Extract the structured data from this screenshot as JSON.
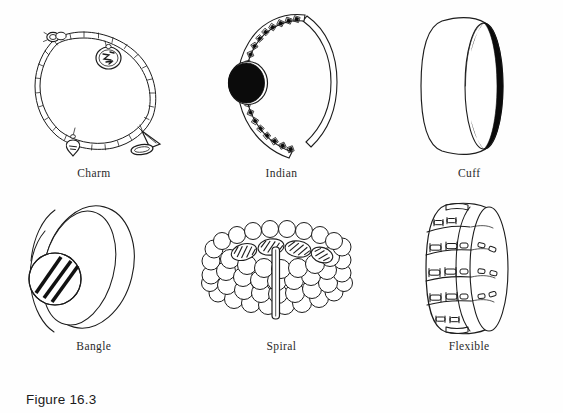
{
  "figure": {
    "caption": "Figure 16.3",
    "number": "16.3",
    "background_color": "#fefefe",
    "ink_color": "#1c1c1c"
  },
  "items": [
    {
      "id": "charm",
      "label": "Charm",
      "icon": "charm-bracelet-illustration",
      "row": 1,
      "column": 1,
      "description": "Oval chain-link bracelet with clasp, round disc charm, heart charm and shoe charm"
    },
    {
      "id": "indian",
      "label": "Indian",
      "icon": "indian-bracelet-illustration",
      "row": 1,
      "column": 2,
      "description": "Open C-shaped cuff with large black oval stone and small inset square stones",
      "stone_color": "#0b0b0b"
    },
    {
      "id": "cuff",
      "label": "Cuff",
      "icon": "cuff-bracelet-illustration",
      "row": 1,
      "column": 3,
      "description": "Wide solid band in three-quarter perspective with dark inner crescent",
      "shadow_color": "#0b0b0b"
    },
    {
      "id": "bangle",
      "label": "Bangle",
      "icon": "bangle-bracelet-illustration",
      "row": 2,
      "column": 1,
      "description": "Tilted rigid band with round medallion bearing diagonal stripes"
    },
    {
      "id": "spiral",
      "label": "Spiral",
      "icon": "spiral-bracelet-illustration",
      "row": 2,
      "column": 2,
      "description": "Coiled rows of round beads with hatched top row and vertical spacer bar"
    },
    {
      "id": "flexible",
      "label": "Flexible",
      "icon": "flexible-bracelet-illustration",
      "row": 2,
      "column": 3,
      "description": "Segmented panel bracelet joined by small bar links"
    }
  ]
}
